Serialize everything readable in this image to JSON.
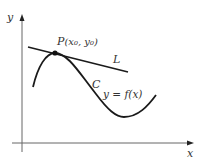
{
  "diagram": {
    "axes": {
      "x_label": "x",
      "y_label": "y"
    },
    "point": {
      "label": "P",
      "coords": "(x₀, y₀)"
    },
    "tangent_line": {
      "label": "L"
    },
    "curve": {
      "name_label": "C",
      "equation_label": "y = f(x)"
    },
    "colors": {
      "stroke": "#1a1a1a",
      "axis": "#555555",
      "text": "#333333"
    }
  }
}
